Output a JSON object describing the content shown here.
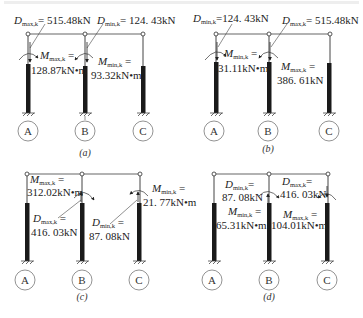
{
  "top_strip": {
    "note": "clipped text line (illegible)"
  },
  "panels": [
    {
      "id": "a",
      "caption": "(a)",
      "columns": [
        "A",
        "B",
        "C"
      ],
      "labels": {
        "d1_sym": "D",
        "d1_sub": "max,k",
        "d1_val": "= 515.48kN",
        "d2_sym": "D",
        "d2_sub": "min,k",
        "d2_val": "= 124. 43kN",
        "m1_sym": "M",
        "m1_sub": "max,k",
        "m1_eq": " =",
        "m1_val": "128.87kN•m",
        "m2_sym": "M",
        "m2_sub": "min,k",
        "m2_eq": " =",
        "m2_val": "93.32kN•m"
      }
    },
    {
      "id": "b",
      "caption": "(b)",
      "columns": [
        "A",
        "B",
        "C"
      ],
      "labels": {
        "d1_sym": "D",
        "d1_sub": "min,k",
        "d1_val": "=124. 43kN",
        "d2_sym": "D",
        "d2_sub": "max,k",
        "d2_val": "= 515.48kN",
        "m1_sym": "M",
        "m1_sub": "min,k",
        "m1_eq": " =",
        "m1_val": "31.11kN•m",
        "m2_sym": "M",
        "m2_sub": "max,k",
        "m2_eq": " =",
        "m2_val": "386. 61kN"
      }
    },
    {
      "id": "c",
      "caption": "(c)",
      "columns": [
        "A",
        "B",
        "C"
      ],
      "labels": {
        "m1_sym": "M",
        "m1_sub": "max,k",
        "m1_eq": " =",
        "m1_val": "312.02kN•m",
        "d1_sym": "D",
        "d1_sub": "max,k",
        "d1_eq": " =",
        "d1_val": "416. 03kN",
        "d2_sym": "D",
        "d2_sub": "min,k",
        "d2_eq": " =",
        "d2_val": "87. 08kN",
        "m2_sym": "M",
        "m2_sub": "min,k",
        "m2_eq": " =",
        "m2_val": "21. 77kN•m"
      }
    },
    {
      "id": "d",
      "caption": "(d)",
      "columns": [
        "A",
        "B",
        "C"
      ],
      "labels": {
        "d1_sym": "D",
        "d1_sub": "min,k",
        "d1_eq": "=",
        "d1_val": "87. 08kN",
        "m1_sym": "M",
        "m1_sub": "min,k",
        "m1_eq": " =",
        "m1_val": "65.31kN•m",
        "d2_sym": "D",
        "d2_sub": "max,k",
        "d2_eq": "=",
        "d2_val": "416. 03kN",
        "m2_sym": "M",
        "m2_sub": "max,k",
        "m2_eq": " =",
        "m2_val": "104.01kN•m"
      }
    }
  ],
  "colors": {
    "line": "#555555",
    "column": "#1a1a1a",
    "text": "#222222"
  }
}
